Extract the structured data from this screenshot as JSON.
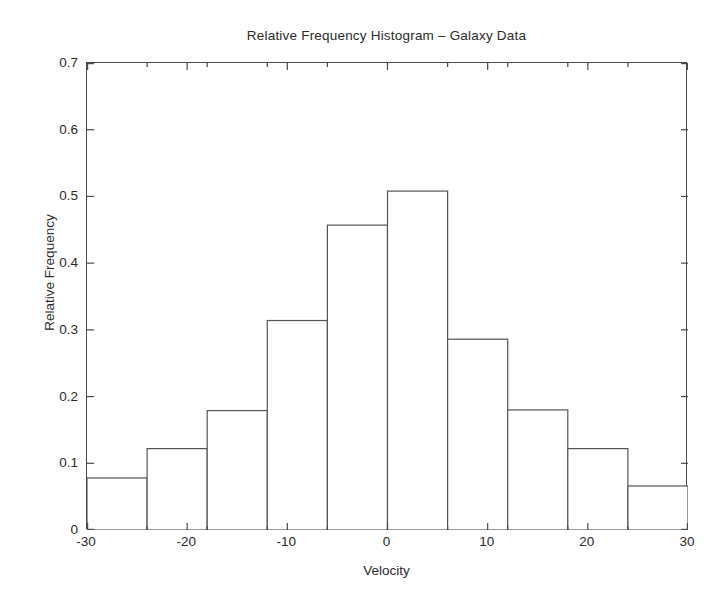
{
  "chart_data": {
    "type": "bar",
    "title": "Relative Frequency Histogram – Galaxy Data",
    "xlabel": "Velocity",
    "ylabel": "Relative Frequency",
    "bin_edges": [
      -30,
      -24,
      -18,
      -12,
      -6,
      0,
      6,
      12,
      18,
      24,
      30
    ],
    "bin_width": 6,
    "categories": [
      "-30 to -24",
      "-24 to -18",
      "-18 to -12",
      "-12 to -6",
      "-6 to 0",
      "0 to 6",
      "6 to 12",
      "12 to 18",
      "18 to 24",
      "24 to 30"
    ],
    "values": [
      0.078,
      0.122,
      0.179,
      0.314,
      0.457,
      0.508,
      0.286,
      0.18,
      0.122,
      0.066
    ],
    "xlim": [
      -30,
      30
    ],
    "ylim": [
      0,
      0.7
    ],
    "xticks": [
      -30,
      -20,
      -10,
      0,
      10,
      20,
      30
    ],
    "xtick_labels": [
      "-30",
      "-20",
      "-10",
      "0",
      "10",
      "20",
      "30"
    ],
    "xminor_ticks": [
      -24,
      -18,
      -12,
      -6,
      6,
      12,
      18,
      24
    ],
    "yticks": [
      0,
      0.1,
      0.2,
      0.3,
      0.4,
      0.5,
      0.6,
      0.7
    ],
    "ytick_labels": [
      "0",
      "0.1",
      "0.2",
      "0.3",
      "0.4",
      "0.5",
      "0.6",
      "0.7"
    ],
    "grid": false,
    "legend": false,
    "bar_fill": "#ffffff",
    "bar_edge_color": "#555555",
    "axis_color": "#4a4a4a",
    "background": "#ffffff"
  }
}
